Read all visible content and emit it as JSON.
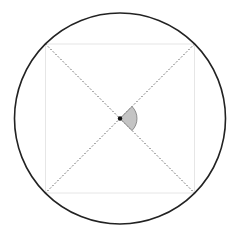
{
  "diagram": {
    "type": "geometry",
    "caption_clipped": "",
    "circle": {
      "cx": 120,
      "cy": 118.5,
      "r": 105.5,
      "stroke": "#222222",
      "stroke_width": 1.6
    },
    "square": {
      "x1": 45.5,
      "y1": 44,
      "x2": 194.5,
      "y2": 193,
      "stroke": "#e6e6e6"
    },
    "diagonals": {
      "stroke": "#555555",
      "dash": "1.5 2"
    },
    "center_point": {
      "r": 2.2,
      "fill": "#111111"
    },
    "angle_sector": {
      "radius": 17,
      "start_deg": -45,
      "end_deg": 45,
      "fill": "#c4c4c4",
      "stroke": "#777777"
    }
  }
}
